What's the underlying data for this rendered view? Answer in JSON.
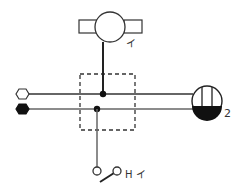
{
  "diagram": {
    "type": "wiring-schematic",
    "colors": {
      "line_dark": "#222222",
      "line_gray": "#555555",
      "dashed_box": "#333333",
      "fill_black": "#111111",
      "background": "#ffffff"
    },
    "components": {
      "top_device": {
        "label": "イ",
        "shape": "circle-with-side-rectangles"
      },
      "right_device": {
        "label": "2",
        "shape": "circle-half-filled-with-vertical-bars"
      },
      "switch": {
        "label": "H イ",
        "shape": "single-pole-switch"
      },
      "terminal_open": {
        "shape": "hexagon-hollow"
      },
      "terminal_filled": {
        "shape": "hexagon-filled"
      },
      "junction_box": {
        "shape": "dashed-rectangle"
      }
    },
    "wires": [
      {
        "name": "upper-wire",
        "from": "terminal_open",
        "to": "right_device"
      },
      {
        "name": "lower-wire",
        "from": "terminal_filled",
        "to": "right_device"
      },
      {
        "name": "top-drop",
        "from": "top_device",
        "to": "upper-wire"
      },
      {
        "name": "switch-drop",
        "from": "lower-wire",
        "to": "switch"
      }
    ]
  }
}
